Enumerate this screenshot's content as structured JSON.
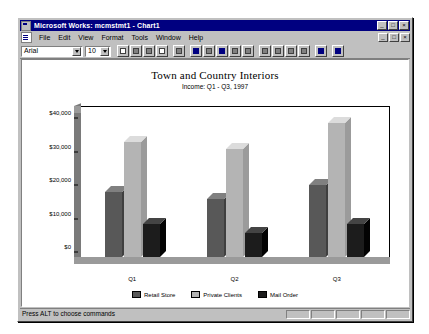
{
  "window": {
    "title": "Microsoft Works: mcmstmt1 - Chart1",
    "app_icon": "works-icon",
    "controls": {
      "minimize": "_",
      "maximize": "□",
      "close": "×"
    },
    "doc_controls": {
      "minimize": "_",
      "restore": "□",
      "close": "×"
    }
  },
  "menu": {
    "items": [
      "File",
      "Edit",
      "View",
      "Format",
      "Tools",
      "Window",
      "Help"
    ]
  },
  "toolbar": {
    "font_name": "Arial",
    "font_size": "10",
    "buttons": [
      "new-icon",
      "save-icon",
      "print-icon",
      "print-preview-icon",
      "copy-icon",
      "bold-icon",
      "underline-icon",
      "pie-chart-icon",
      "bar-chart-icon",
      "column-chart-icon",
      "line-chart-icon",
      "area-chart-icon",
      "scatter-chart-icon",
      "combo-chart-icon",
      "chart-type-icon",
      "help-icon"
    ]
  },
  "status": {
    "message": "Press ALT to choose commands",
    "panes": [
      "",
      "",
      "",
      "",
      ""
    ]
  },
  "chart_data": {
    "type": "bar",
    "title": "Town and Country Interiors",
    "subtitle": "Income: Q1 - Q3, 1997",
    "xlabel": "",
    "ylabel": "",
    "categories": [
      "Q1",
      "Q2",
      "Q3"
    ],
    "series": [
      {
        "name": "Retail Store",
        "color": "#585858",
        "values": [
          19000,
          17000,
          21000
        ]
      },
      {
        "name": "Private Clients",
        "color": "#b4b4b4",
        "values": [
          33500,
          31500,
          39000
        ]
      },
      {
        "name": "Mail Order",
        "color": "#1c1c1c",
        "values": [
          9500,
          7000,
          9500
        ]
      }
    ],
    "ylim": [
      0,
      44000
    ],
    "yticks": [
      0,
      10000,
      20000,
      30000,
      40000
    ],
    "ytick_labels": [
      "$0",
      "$10,000",
      "$20,000",
      "$30,000",
      "$40,000"
    ],
    "grid": false,
    "legend_position": "bottom",
    "three_d": true
  }
}
